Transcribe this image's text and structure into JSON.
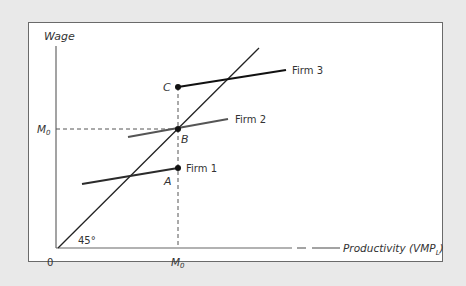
{
  "diagram": {
    "axes": {
      "y_label": "Wage",
      "x_label_main": "Productivity (VMP",
      "x_label_sub": "L",
      "x_label_close": ")",
      "origin": "0",
      "angle_label": "45°"
    },
    "ticks": {
      "x_tick_main": "M",
      "x_tick_sub": "0",
      "y_tick_main": "M",
      "y_tick_sub": "0"
    },
    "points": [
      {
        "id": "A",
        "label": "A"
      },
      {
        "id": "B",
        "label": "B"
      },
      {
        "id": "C",
        "label": "C"
      }
    ],
    "lines": [
      {
        "id": "firm1",
        "label": "Firm 1",
        "color": "#2b2b2b"
      },
      {
        "id": "firm2",
        "label": "Firm 2",
        "color": "#555555"
      },
      {
        "id": "firm3",
        "label": "Firm 3",
        "color": "#111111"
      }
    ],
    "colors": {
      "background": "#e9e9e9",
      "panel": "#ffffff",
      "axis": "#555555",
      "forty_five_line": "#222222",
      "dashed_guides": "#555555"
    }
  }
}
